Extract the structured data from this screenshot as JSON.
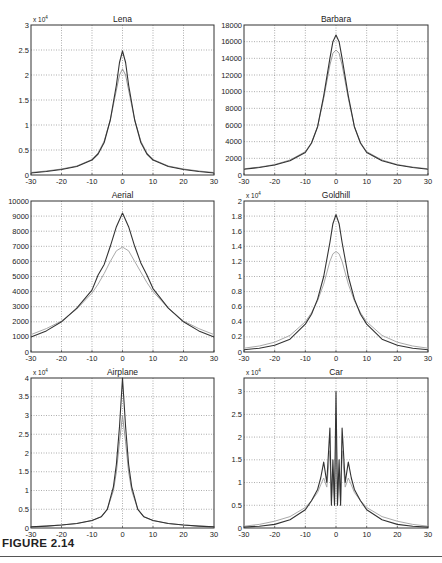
{
  "figure": {
    "caption": "FIGURE 2.14"
  },
  "chart_data": [
    {
      "type": "line",
      "title": "Lena",
      "exponent_label": "x 10^4",
      "xlim": [
        -30,
        30
      ],
      "ylim": [
        0,
        3
      ],
      "xticks": [
        -30,
        -20,
        -10,
        0,
        10,
        20,
        30
      ],
      "yticks": [
        0,
        0.5,
        1,
        1.5,
        2,
        2.5,
        3
      ],
      "ytick_labels": [
        "0",
        "0.5",
        "1",
        "1.5",
        "2",
        "2.5",
        "3"
      ],
      "grid": true,
      "x": [
        -30,
        -25,
        -20,
        -15,
        -10,
        -8,
        -6,
        -4,
        -2,
        -1,
        0,
        1,
        2,
        4,
        6,
        8,
        10,
        15,
        20,
        25,
        30
      ],
      "series": [
        {
          "name": "dark",
          "color": "#333333",
          "values": [
            0.04,
            0.07,
            0.11,
            0.17,
            0.3,
            0.42,
            0.65,
            1.1,
            1.8,
            2.25,
            2.48,
            2.25,
            1.8,
            1.1,
            0.65,
            0.42,
            0.3,
            0.17,
            0.11,
            0.07,
            0.04
          ]
        },
        {
          "name": "light",
          "color": "#999999",
          "values": [
            0.05,
            0.08,
            0.12,
            0.18,
            0.31,
            0.44,
            0.68,
            1.1,
            1.7,
            2.0,
            2.12,
            2.0,
            1.7,
            1.1,
            0.68,
            0.44,
            0.31,
            0.18,
            0.12,
            0.08,
            0.05
          ]
        }
      ]
    },
    {
      "type": "line",
      "title": "Barbara",
      "exponent_label": "",
      "xlim": [
        -30,
        30
      ],
      "ylim": [
        0,
        18000
      ],
      "xticks": [
        -30,
        -20,
        -10,
        0,
        10,
        20,
        30
      ],
      "yticks": [
        0,
        2000,
        4000,
        6000,
        8000,
        10000,
        12000,
        14000,
        16000,
        18000
      ],
      "ytick_labels": [
        "0",
        "2000",
        "4000",
        "6000",
        "8000",
        "10000",
        "12000",
        "14000",
        "16000",
        "18000"
      ],
      "grid": true,
      "x": [
        -30,
        -25,
        -20,
        -15,
        -10,
        -8,
        -6,
        -4,
        -2,
        -1,
        0,
        1,
        2,
        4,
        6,
        8,
        10,
        15,
        20,
        25,
        30
      ],
      "series": [
        {
          "name": "dark",
          "color": "#333333",
          "values": [
            700,
            900,
            1200,
            1700,
            2700,
            3800,
            5800,
            9500,
            14000,
            16000,
            16800,
            16000,
            14000,
            9500,
            5800,
            3800,
            2700,
            1700,
            1200,
            900,
            700
          ]
        },
        {
          "name": "light",
          "color": "#999999",
          "values": [
            750,
            950,
            1250,
            1800,
            2800,
            3900,
            5800,
            9200,
            13200,
            14600,
            15000,
            14600,
            13200,
            9200,
            5800,
            3900,
            2800,
            1800,
            1250,
            950,
            750
          ]
        }
      ]
    },
    {
      "type": "line",
      "title": "Aerial",
      "exponent_label": "",
      "xlim": [
        -30,
        30
      ],
      "ylim": [
        0,
        10000
      ],
      "xticks": [
        -30,
        -20,
        -10,
        0,
        10,
        20,
        30
      ],
      "yticks": [
        0,
        1000,
        2000,
        3000,
        4000,
        5000,
        6000,
        7000,
        8000,
        9000,
        10000
      ],
      "ytick_labels": [
        "0",
        "1000",
        "2000",
        "3000",
        "4000",
        "5000",
        "6000",
        "7000",
        "8000",
        "9000",
        "10000"
      ],
      "grid": true,
      "x": [
        -30,
        -25,
        -20,
        -15,
        -10,
        -8,
        -6,
        -4,
        -2,
        0,
        2,
        4,
        6,
        8,
        10,
        15,
        20,
        25,
        30
      ],
      "series": [
        {
          "name": "dark",
          "color": "#333333",
          "values": [
            1000,
            1400,
            2000,
            2900,
            4100,
            5100,
            5800,
            7000,
            8300,
            9200,
            8300,
            7000,
            5900,
            5100,
            4200,
            2900,
            2000,
            1400,
            1000
          ]
        },
        {
          "name": "light",
          "color": "#aaaaaa",
          "values": [
            1150,
            1550,
            2050,
            2850,
            3900,
            4500,
            5200,
            6000,
            6700,
            6950,
            6700,
            6000,
            5300,
            4600,
            4000,
            2900,
            2050,
            1550,
            1150
          ]
        }
      ]
    },
    {
      "type": "line",
      "title": "Goldhill",
      "exponent_label": "x 10^4",
      "xlim": [
        -30,
        30
      ],
      "ylim": [
        0,
        2
      ],
      "xticks": [
        -30,
        -20,
        -10,
        0,
        10,
        20,
        30
      ],
      "yticks": [
        0,
        0.2,
        0.4,
        0.6,
        0.8,
        1,
        1.2,
        1.4,
        1.6,
        1.8,
        2
      ],
      "ytick_labels": [
        "0",
        "0.2",
        "0.4",
        "0.6",
        "0.8",
        "1",
        "1.2",
        "1.4",
        "1.6",
        "1.8",
        "2"
      ],
      "grid": true,
      "x": [
        -30,
        -25,
        -20,
        -15,
        -10,
        -8,
        -6,
        -4,
        -2,
        -1,
        0,
        1,
        2,
        4,
        6,
        8,
        10,
        15,
        20,
        25,
        30
      ],
      "series": [
        {
          "name": "dark",
          "color": "#333333",
          "values": [
            0.03,
            0.05,
            0.09,
            0.17,
            0.37,
            0.5,
            0.7,
            1.0,
            1.45,
            1.7,
            1.82,
            1.7,
            1.45,
            1.0,
            0.7,
            0.5,
            0.37,
            0.17,
            0.09,
            0.05,
            0.03
          ]
        },
        {
          "name": "light",
          "color": "#aaaaaa",
          "values": [
            0.05,
            0.08,
            0.13,
            0.22,
            0.4,
            0.52,
            0.68,
            0.9,
            1.2,
            1.3,
            1.33,
            1.3,
            1.2,
            0.9,
            0.68,
            0.52,
            0.4,
            0.22,
            0.13,
            0.08,
            0.05
          ]
        }
      ]
    },
    {
      "type": "line",
      "title": "Airplane",
      "exponent_label": "x 10^4",
      "xlim": [
        -30,
        30
      ],
      "ylim": [
        0,
        4
      ],
      "xticks": [
        -30,
        -20,
        -10,
        0,
        10,
        20,
        30
      ],
      "yticks": [
        0,
        0.5,
        1,
        1.5,
        2,
        2.5,
        3,
        3.5,
        4
      ],
      "ytick_labels": [
        "0",
        "0.5",
        "1",
        "1.5",
        "2",
        "2.5",
        "3",
        "3.5",
        "4"
      ],
      "grid": true,
      "x": [
        -30,
        -25,
        -20,
        -15,
        -10,
        -7,
        -5,
        -3,
        -2,
        -1,
        0,
        1,
        2,
        3,
        5,
        7,
        10,
        15,
        20,
        25,
        30
      ],
      "series": [
        {
          "name": "dark",
          "color": "#333333",
          "values": [
            0.03,
            0.05,
            0.08,
            0.12,
            0.2,
            0.3,
            0.5,
            1.1,
            1.7,
            2.7,
            4.0,
            2.7,
            1.7,
            1.1,
            0.5,
            0.3,
            0.2,
            0.12,
            0.08,
            0.05,
            0.03
          ]
        },
        {
          "name": "light",
          "color": "#999999",
          "values": [
            0.03,
            0.05,
            0.08,
            0.12,
            0.2,
            0.3,
            0.5,
            1.0,
            1.5,
            2.3,
            3.0,
            2.3,
            1.5,
            1.0,
            0.5,
            0.3,
            0.2,
            0.12,
            0.08,
            0.05,
            0.03
          ]
        }
      ]
    },
    {
      "type": "line",
      "title": "Car",
      "exponent_label": "x 10^4",
      "xlim": [
        -30,
        30
      ],
      "ylim": [
        0,
        3.3
      ],
      "xticks": [
        -30,
        -20,
        -10,
        0,
        10,
        20,
        30
      ],
      "yticks": [
        0,
        0.5,
        1,
        1.5,
        2,
        2.5,
        3
      ],
      "ytick_labels": [
        "0",
        "0.5",
        "1",
        "1.5",
        "2",
        "2.5",
        "3"
      ],
      "grid": true,
      "x": [
        -30,
        -25,
        -20,
        -15,
        -10,
        -8,
        -6,
        -5,
        -4,
        -3,
        -2,
        -1.5,
        -1,
        -0.5,
        0,
        0.5,
        1,
        1.5,
        2,
        3,
        4,
        5,
        6,
        8,
        10,
        15,
        20,
        25,
        30
      ],
      "series": [
        {
          "name": "dark",
          "color": "#333333",
          "values": [
            0.02,
            0.04,
            0.08,
            0.18,
            0.4,
            0.6,
            0.85,
            1.1,
            1.45,
            1.0,
            2.2,
            0.5,
            1.5,
            0.5,
            3.0,
            0.5,
            1.5,
            0.5,
            2.2,
            1.0,
            1.45,
            1.1,
            0.85,
            0.6,
            0.4,
            0.18,
            0.08,
            0.04,
            0.02
          ]
        },
        {
          "name": "light",
          "color": "#aaaaaa",
          "values": [
            0.04,
            0.08,
            0.15,
            0.25,
            0.45,
            0.6,
            0.78,
            0.95,
            1.1,
            0.9,
            1.7,
            0.6,
            1.2,
            0.6,
            2.4,
            0.6,
            1.2,
            0.6,
            1.7,
            0.9,
            1.1,
            0.95,
            0.78,
            0.6,
            0.45,
            0.25,
            0.15,
            0.08,
            0.04
          ]
        }
      ]
    }
  ]
}
